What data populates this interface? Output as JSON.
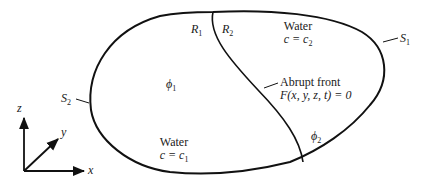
{
  "diagram": {
    "boundary_labels": {
      "s1": {
        "symbol": "S",
        "sub": "1"
      },
      "s2": {
        "symbol": "S",
        "sub": "2"
      }
    },
    "region_labels": {
      "r1": {
        "symbol": "R",
        "sub": "1"
      },
      "r2": {
        "symbol": "R",
        "sub": "2"
      }
    },
    "potentials": {
      "phi1": {
        "symbol": "ϕ",
        "sub": "1"
      },
      "phi2": {
        "symbol": "ϕ",
        "sub": "2"
      }
    },
    "water_top": {
      "title": "Water",
      "eq_lhs": "c = c",
      "eq_sub": "2"
    },
    "water_bottom": {
      "title": "Water",
      "eq_lhs": "c = c",
      "eq_sub": "1"
    },
    "front": {
      "title": "Abrupt front",
      "equation": "F(x, y, z, t) = 0"
    },
    "axes": {
      "x": "x",
      "y": "y",
      "z": "z"
    },
    "colors": {
      "stroke": "#111111",
      "background": "#ffffff"
    }
  }
}
